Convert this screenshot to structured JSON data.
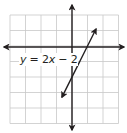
{
  "chart_data": {
    "type": "line",
    "title": "",
    "xlabel": "",
    "ylabel": "",
    "grid": true,
    "xlim": [
      -4,
      3
    ],
    "ylim": [
      -5,
      2
    ],
    "tick_labels_shown": false,
    "axes_arrows": true,
    "series": [
      {
        "name": "y = 2x - 2",
        "equation": "y = 2x - 2",
        "slope": 2,
        "intercept": -2,
        "x": [
          -0.65,
          1.55
        ],
        "y": [
          -3.3,
          1.1
        ],
        "arrows_both_ends": true
      }
    ],
    "annotations": [
      {
        "text": "y = 2x − 2",
        "x": -3.5,
        "y": -0.8
      }
    ],
    "key_points": [
      {
        "x": 0,
        "y": -2,
        "label": "y-intercept"
      },
      {
        "x": 1,
        "y": 0,
        "label": "x-intercept"
      }
    ]
  },
  "label": {
    "y_var": "y",
    "equals": " = 2",
    "x_var": "x",
    "rest": " − 2"
  },
  "colors": {
    "grid": "#c8c8c8",
    "axis": "#231f20",
    "line": "#231f20",
    "background": "#ffffff"
  }
}
